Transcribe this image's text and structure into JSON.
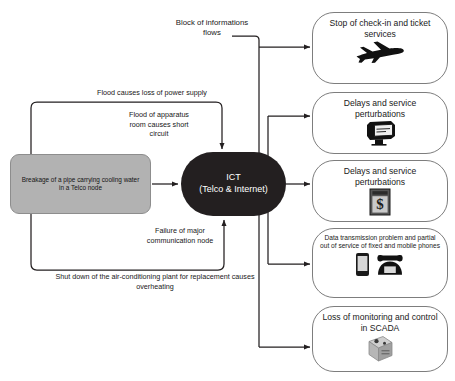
{
  "diagram": {
    "colors": {
      "source_fill": "#b2b2b2",
      "source_stroke": "#8d8d8d",
      "hub_fill": "#231f20",
      "hub_text": "#ffffff",
      "pill_stroke": "#7d7d7d",
      "wire": "#231f20",
      "background": "#ffffff"
    },
    "source": {
      "name": "breakage-node",
      "text": "Breakage of a pipe carrying cooling water in a Telco node"
    },
    "hub": {
      "name": "ict-node",
      "line1": "ICT",
      "line2": "(Telco & Internet)"
    },
    "edge_labels": [
      {
        "id": "flood-power",
        "text": "Flood causes loss of power supply"
      },
      {
        "id": "flood-apparatus",
        "text": "Flood of apparatus room causes short circuit"
      },
      {
        "id": "failure-comm",
        "text": "Failure of major communication node"
      },
      {
        "id": "shutdown-ac",
        "text": "Shut down of the air-conditioning plant for replacement causes overheating"
      },
      {
        "id": "block-info",
        "text": "Block of informations flows"
      }
    ],
    "outcomes": [
      {
        "id": "check-in",
        "text": "Stop of check-in and ticket services",
        "icon": "airplane-icon",
        "size": "large"
      },
      {
        "id": "delays-transit",
        "text": "Delays and service perturbations",
        "icon": "ticket-validator-icon",
        "size": "large"
      },
      {
        "id": "delays-banking",
        "text": "Delays and service perturbations",
        "icon": "atm-dollar-icon",
        "size": "large"
      },
      {
        "id": "telecom",
        "text": "Data transmission problem and partial out of service of fixed and mobile phones",
        "icon": "phones-icon",
        "size": "small"
      },
      {
        "id": "scada",
        "text": "Loss of monitoring and control in SCADA",
        "icon": "rtu-device-icon",
        "size": "large"
      }
    ]
  }
}
